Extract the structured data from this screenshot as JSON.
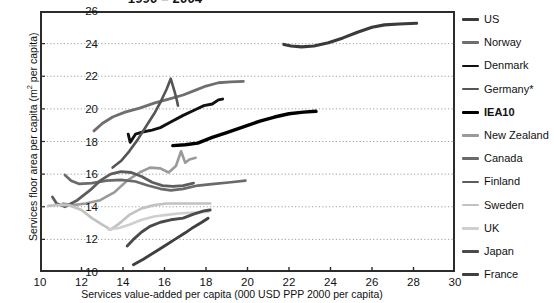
{
  "chart_data": {
    "type": "line",
    "title": "1990 – 2004",
    "xlabel": "Services value-added per capita (000 USD PPP 2000 per capita)",
    "ylabel_main": "Services floor area per capita (m",
    "ylabel_sup": "2",
    "ylabel_tail": " per capita)",
    "ylabel_full": "Services floor area per capita (m² per capita)",
    "xlim": [
      10,
      30
    ],
    "ylim": [
      10,
      26
    ],
    "xticks": [
      10,
      12,
      14,
      16,
      18,
      20,
      22,
      24,
      26,
      28,
      30
    ],
    "yticks": [
      10,
      12,
      14,
      16,
      18,
      20,
      22,
      24,
      26
    ],
    "grid": "horizontal-dotted",
    "legend_position": "right",
    "series": [
      {
        "name": "US",
        "color": "#3a3a3a",
        "width": 3.1,
        "points": [
          [
            21.75,
            23.95
          ],
          [
            22.1,
            23.85
          ],
          [
            22.6,
            23.8
          ],
          [
            23.2,
            23.85
          ],
          [
            23.9,
            24.05
          ],
          [
            24.6,
            24.35
          ],
          [
            25.3,
            24.7
          ],
          [
            26.0,
            25.0
          ],
          [
            26.6,
            25.15
          ],
          [
            27.3,
            25.2
          ],
          [
            28.15,
            25.25
          ]
        ]
      },
      {
        "name": "Norway",
        "color": "#6e6e6e",
        "width": 2.8,
        "points": [
          [
            12.6,
            18.65
          ],
          [
            13.0,
            19.1
          ],
          [
            13.5,
            19.5
          ],
          [
            14.1,
            19.8
          ],
          [
            14.8,
            20.05
          ],
          [
            15.5,
            20.35
          ],
          [
            16.2,
            20.6
          ],
          [
            16.9,
            20.85
          ],
          [
            17.5,
            21.15
          ],
          [
            18.0,
            21.4
          ],
          [
            18.6,
            21.6
          ],
          [
            19.2,
            21.65
          ],
          [
            19.8,
            21.68
          ]
        ]
      },
      {
        "name": "Denmark",
        "color": "#111111",
        "width": 2.9,
        "points": [
          [
            14.25,
            18.45
          ],
          [
            14.35,
            17.95
          ],
          [
            14.6,
            18.45
          ],
          [
            15.0,
            18.6
          ],
          [
            15.4,
            18.7
          ],
          [
            15.8,
            18.85
          ],
          [
            16.3,
            19.2
          ],
          [
            16.9,
            19.6
          ],
          [
            17.4,
            19.9
          ],
          [
            17.9,
            20.2
          ],
          [
            18.3,
            20.3
          ],
          [
            18.6,
            20.55
          ],
          [
            18.8,
            20.6
          ]
        ]
      },
      {
        "name": "Germany*",
        "color": "#555555",
        "width": 2.6,
        "points": [
          [
            13.5,
            16.4
          ],
          [
            13.9,
            16.8
          ],
          [
            14.3,
            17.4
          ],
          [
            14.7,
            18.1
          ],
          [
            15.1,
            18.9
          ],
          [
            15.5,
            19.7
          ],
          [
            15.8,
            20.4
          ],
          [
            16.1,
            21.2
          ],
          [
            16.3,
            21.85
          ],
          [
            16.5,
            21.0
          ],
          [
            16.6,
            20.5
          ],
          [
            16.65,
            20.2
          ]
        ]
      },
      {
        "name": "IEA10",
        "color": "#000000",
        "width": 3.4,
        "points": [
          [
            16.4,
            17.75
          ],
          [
            17.0,
            17.8
          ],
          [
            17.6,
            17.9
          ],
          [
            18.3,
            18.25
          ],
          [
            19.0,
            18.55
          ],
          [
            19.8,
            18.9
          ],
          [
            20.6,
            19.25
          ],
          [
            21.3,
            19.5
          ],
          [
            22.0,
            19.7
          ],
          [
            22.7,
            19.8
          ],
          [
            23.3,
            19.85
          ]
        ]
      },
      {
        "name": "New Zealand",
        "color": "#9a9a9a",
        "width": 2.6,
        "points": [
          [
            11.1,
            14.2
          ],
          [
            11.6,
            14.1
          ],
          [
            12.2,
            14.2
          ],
          [
            12.9,
            14.4
          ],
          [
            13.6,
            14.9
          ],
          [
            14.2,
            15.6
          ],
          [
            14.8,
            16.1
          ],
          [
            15.3,
            16.4
          ],
          [
            15.8,
            16.35
          ],
          [
            16.2,
            16.1
          ],
          [
            16.55,
            16.5
          ],
          [
            16.8,
            17.4
          ],
          [
            17.0,
            16.7
          ],
          [
            17.2,
            16.9
          ],
          [
            17.5,
            17.0
          ]
        ]
      },
      {
        "name": "Canada",
        "color": "#6a6a6a",
        "width": 2.7,
        "points": [
          [
            11.2,
            15.95
          ],
          [
            11.5,
            15.6
          ],
          [
            11.9,
            15.4
          ],
          [
            12.5,
            15.45
          ],
          [
            13.2,
            15.6
          ],
          [
            13.9,
            15.65
          ],
          [
            14.6,
            15.55
          ],
          [
            15.2,
            15.3
          ],
          [
            15.8,
            15.1
          ],
          [
            16.3,
            15.0
          ],
          [
            16.9,
            15.1
          ],
          [
            17.6,
            15.3
          ],
          [
            18.4,
            15.4
          ],
          [
            19.2,
            15.5
          ],
          [
            19.9,
            15.6
          ]
        ]
      },
      {
        "name": "Finland",
        "color": "#5d5d5d",
        "width": 2.8,
        "points": [
          [
            10.6,
            14.6
          ],
          [
            10.8,
            14.2
          ],
          [
            11.2,
            14.0
          ],
          [
            11.8,
            14.4
          ],
          [
            12.4,
            15.0
          ],
          [
            12.9,
            15.6
          ],
          [
            13.4,
            16.0
          ],
          [
            13.9,
            16.15
          ],
          [
            14.4,
            16.1
          ],
          [
            14.9,
            15.85
          ],
          [
            15.4,
            15.5
          ],
          [
            15.9,
            15.3
          ],
          [
            16.4,
            15.25
          ],
          [
            16.9,
            15.3
          ],
          [
            17.4,
            15.45
          ]
        ]
      },
      {
        "name": "Sweden",
        "color": "#c2c2c2",
        "width": 2.7,
        "points": [
          [
            10.4,
            14.05
          ],
          [
            10.8,
            14.1
          ],
          [
            11.4,
            14.1
          ],
          [
            12.0,
            13.8
          ],
          [
            12.5,
            13.3
          ],
          [
            13.0,
            12.9
          ],
          [
            13.4,
            12.6
          ],
          [
            13.8,
            12.95
          ],
          [
            14.3,
            13.5
          ],
          [
            14.9,
            13.9
          ],
          [
            15.5,
            14.1
          ],
          [
            16.1,
            14.2
          ],
          [
            16.8,
            14.2
          ],
          [
            17.5,
            14.2
          ],
          [
            18.2,
            14.2
          ]
        ]
      },
      {
        "name": "UK",
        "color": "#cfcfcf",
        "width": 2.6,
        "points": [
          [
            13.3,
            12.6
          ],
          [
            13.8,
            12.7
          ],
          [
            14.3,
            12.9
          ],
          [
            14.9,
            13.2
          ],
          [
            15.5,
            13.4
          ],
          [
            16.1,
            13.5
          ],
          [
            16.8,
            13.6
          ],
          [
            17.5,
            13.65
          ],
          [
            18.1,
            13.7
          ]
        ]
      },
      {
        "name": "Japan",
        "color": "#4a4a4a",
        "width": 2.9,
        "points": [
          [
            14.2,
            11.6
          ],
          [
            14.5,
            12.0
          ],
          [
            14.9,
            12.45
          ],
          [
            15.3,
            12.8
          ],
          [
            15.8,
            13.05
          ],
          [
            16.3,
            13.2
          ],
          [
            16.9,
            13.3
          ],
          [
            17.4,
            13.55
          ],
          [
            17.9,
            13.75
          ],
          [
            18.2,
            13.8
          ]
        ]
      },
      {
        "name": "France",
        "color": "#3f3f3f",
        "width": 2.9,
        "points": [
          [
            14.5,
            10.45
          ],
          [
            15.0,
            10.8
          ],
          [
            15.5,
            11.2
          ],
          [
            16.0,
            11.6
          ],
          [
            16.5,
            12.0
          ],
          [
            17.0,
            12.4
          ],
          [
            17.4,
            12.75
          ],
          [
            17.8,
            13.05
          ],
          [
            18.1,
            13.3
          ]
        ]
      }
    ]
  },
  "legend": {
    "items": [
      {
        "label": "US"
      },
      {
        "label": "Norway"
      },
      {
        "label": "Denmark"
      },
      {
        "label": "Germany*"
      },
      {
        "label": "IEA10"
      },
      {
        "label": "New Zealand"
      },
      {
        "label": "Canada"
      },
      {
        "label": "Finland"
      },
      {
        "label": "Sweden"
      },
      {
        "label": "UK"
      },
      {
        "label": "Japan"
      },
      {
        "label": "France"
      }
    ]
  }
}
